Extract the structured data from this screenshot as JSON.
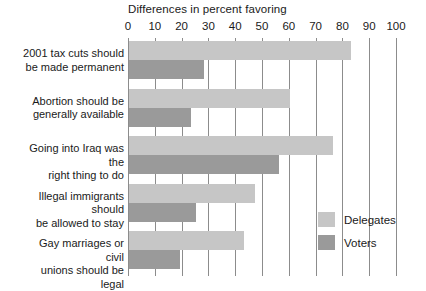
{
  "chart_data": {
    "type": "bar",
    "orientation": "horizontal",
    "title": "Differences in percent favoring",
    "xlabel": "",
    "ylabel": "",
    "xlim": [
      0,
      100
    ],
    "xticks": [
      0,
      10,
      20,
      30,
      40,
      50,
      60,
      70,
      80,
      90,
      100
    ],
    "xtick_labels": [
      "0",
      "10",
      "20",
      "30",
      "40",
      "50",
      "60",
      "70",
      "80",
      "90",
      "100"
    ],
    "grid": true,
    "legend_position": "bottom-right",
    "categories": [
      "2001 tax cuts should be made permanent",
      "Abortion should be generally available",
      "Going into Iraq was the right thing to do",
      "Illegal immigrants should be allowed to stay",
      "Gay marriages or civil unions should be legal"
    ],
    "category_lines": [
      [
        "2001 tax cuts should",
        "be made permanent"
      ],
      [
        "Abortion should be",
        "generally available"
      ],
      [
        "Going into Iraq was the",
        "right thing to do"
      ],
      [
        "Illegal immigrants should",
        "be allowed to stay"
      ],
      [
        "Gay marriages or civil",
        "unions should be legal"
      ]
    ],
    "series": [
      {
        "name": "Delegates",
        "color": "#c6c6c6",
        "values": [
          83,
          60,
          76,
          47,
          43
        ]
      },
      {
        "name": "Voters",
        "color": "#9a9a9a",
        "values": [
          28,
          23,
          56,
          25,
          19
        ]
      }
    ]
  },
  "legend": {
    "items": [
      {
        "label": "Delegates",
        "color": "#c6c6c6"
      },
      {
        "label": "Voters",
        "color": "#9a9a9a"
      }
    ]
  },
  "colors": {
    "delegates": "#c6c6c6",
    "voters": "#9a9a9a",
    "gridline": "#8c8c8c",
    "text": "#1a1a1a",
    "background": "#ffffff"
  }
}
